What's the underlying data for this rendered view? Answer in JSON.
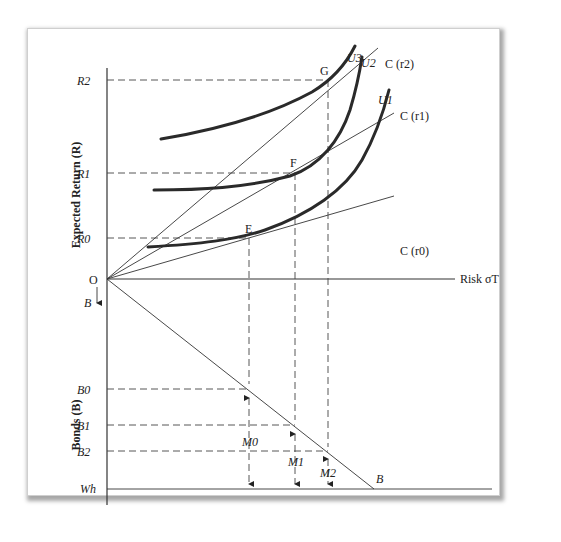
{
  "diagram": {
    "axis_labels": {
      "y_top": "Expected Return (R)",
      "y_bottom": "Bonds (B)",
      "x": "Risk σT",
      "origin": "O",
      "b_arrow": "B",
      "wh": "Wh",
      "b_line_end": "B"
    },
    "return_levels": [
      "R2",
      "R1",
      "R0"
    ],
    "bond_levels": [
      "B0",
      "B1",
      "B2"
    ],
    "money_labels": [
      "M0",
      "M1",
      "M2"
    ],
    "tangency_points": [
      "E",
      "F",
      "G"
    ],
    "indifference_curves": [
      "U1",
      "U2",
      "U3"
    ],
    "constraint_lines": [
      "C (r0)",
      "C (r1)",
      "C (r2)"
    ],
    "colors": {
      "line": "#333333",
      "curve": "#2a2a2a",
      "background": "#ffffff"
    }
  }
}
